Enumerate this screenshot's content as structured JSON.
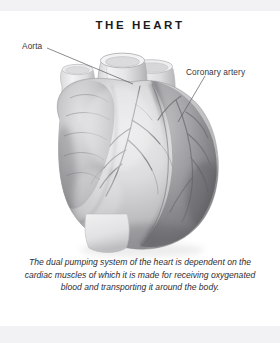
{
  "page": {
    "title": "THE HEART",
    "background_color": "#ffffff",
    "edge_band_color": "#f2f2f4",
    "title_color": "#1b1b1e"
  },
  "labels": [
    {
      "id": "aorta",
      "text": "Aorta",
      "leader_from": [
        47,
        48
      ],
      "leader_to": [
        133,
        84
      ],
      "color": "#35353a"
    },
    {
      "id": "coronary-artery",
      "text": "Coronary artery",
      "leader_from": [
        205,
        76
      ],
      "leader_to": [
        178,
        122
      ],
      "color": "#35353a"
    }
  ],
  "caption": {
    "text": "The dual pumping system of the heart is dependent on the cardiac muscles of which it is made for receiving oxygenated blood and transporting it around the body.",
    "lines": [
      "The dual pumping system of the heart is",
      "dependent on the cardiac muscles of which it is",
      "made for receiving oxygenated blood and",
      "transporting it around the body."
    ],
    "color": "#2e2e33",
    "style": "italic"
  },
  "illustration": {
    "name": "human-heart-anterior-view",
    "style": "grayscale-airbrush-anatomical",
    "palette": {
      "highlight": "#f4f4f5",
      "light": "#dcdcdd",
      "mid": "#b4b4b6",
      "shadow": "#8d8d90",
      "dark": "#6a6a6e",
      "deep": "#4a4a4e",
      "vessel_line": "#6f6f74",
      "cut_vessel_fill": "#f0f0f1",
      "cut_vessel_rim": "#c9c9cb"
    },
    "parts": [
      {
        "name": "aorta",
        "description": "large cut vessel stump, upper center"
      },
      {
        "name": "pulmonary-trunk",
        "description": "cut vessel stump right of aorta"
      },
      {
        "name": "superior-vena-cava",
        "description": "cut vessel stump left of aorta"
      },
      {
        "name": "left-atrial-appendage",
        "description": "lobed scalloped mass upper left"
      },
      {
        "name": "right-ventricle",
        "description": "large pale anterior chamber, center"
      },
      {
        "name": "left-ventricle",
        "description": "dark shaded mass, right side"
      },
      {
        "name": "coronary-arteries",
        "description": "branching vessel lines across surface"
      },
      {
        "name": "apex",
        "description": "rounded lower tip of heart"
      }
    ]
  }
}
